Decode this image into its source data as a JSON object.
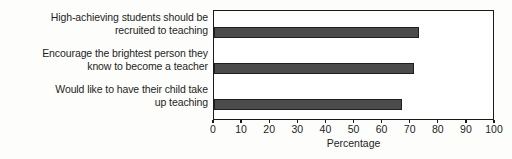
{
  "chart_data": {
    "type": "bar",
    "orientation": "horizontal",
    "title": "",
    "xlabel": "Percentage",
    "ylabel": "",
    "xlim": [
      0,
      100
    ],
    "grid": false,
    "legend": false,
    "bar_color": "#4b4b4b",
    "bar_edge_color": "#1f1f1f",
    "frame_color": "#1a1a1a",
    "xticks": [
      0,
      10,
      20,
      30,
      40,
      50,
      60,
      70,
      80,
      90,
      100
    ],
    "xticklabels": [
      "0",
      "10",
      "20",
      "30",
      "40",
      "50",
      "60",
      "70",
      "80",
      "90",
      "100"
    ],
    "categories": [
      {
        "line1": "High-achieving students should be",
        "line2": "recruited to teaching"
      },
      {
        "line1": "Encourage the brightest person they",
        "line2": "know to become a teacher"
      },
      {
        "line1": "Would like to have their child take",
        "line2": "up teaching"
      }
    ],
    "values": [
      73,
      71,
      67
    ]
  }
}
